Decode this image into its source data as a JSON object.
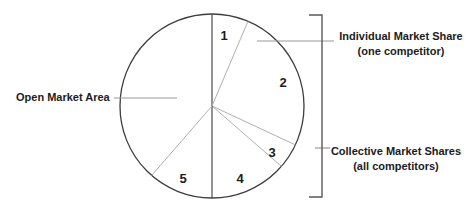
{
  "figure_name": "market-share-pie-diagram",
  "colors": {
    "background": "#ffffff",
    "outline": "#3c3c3c",
    "dark_divider": "#4a4a4a",
    "light_divider": "#b0b0b0",
    "leader": "#9a9a9a",
    "bracket": "#5a5a5a",
    "text": "#1c1c1c"
  },
  "pie": {
    "cx": 212,
    "cy": 106,
    "r": 92,
    "dividers": [
      {
        "angle_deg": 0,
        "tone": "dark"
      },
      {
        "angle_deg": 23,
        "tone": "light"
      },
      {
        "angle_deg": 115,
        "tone": "light"
      },
      {
        "angle_deg": 131,
        "tone": "light"
      },
      {
        "angle_deg": 180,
        "tone": "dark"
      },
      {
        "angle_deg": 221,
        "tone": "light"
      }
    ],
    "segment_labels": [
      {
        "text": "1",
        "x": 224,
        "y": 40
      },
      {
        "text": "2",
        "x": 283,
        "y": 87
      },
      {
        "text": "3",
        "x": 272,
        "y": 157
      },
      {
        "text": "4",
        "x": 240,
        "y": 183
      },
      {
        "text": "5",
        "x": 183,
        "y": 183
      }
    ]
  },
  "leader_lines": [
    {
      "name": "open-market-leader-line",
      "x1": 114,
      "y1": 98,
      "x2": 177,
      "y2": 98
    },
    {
      "name": "individual-share-leader-line",
      "x1": 257,
      "y1": 41,
      "x2": 334,
      "y2": 41
    },
    {
      "name": "collective-share-tick-line",
      "x1": 315,
      "y1": 148,
      "x2": 330,
      "y2": 148
    }
  ],
  "bracket": {
    "points": "309,15 322,15 322,197 309,197"
  },
  "labels": {
    "open_market": "Open Market Area",
    "individual_line1": "Individual Market Share",
    "individual_line2": "(one competitor)",
    "collective_line1": "Collective Market Shares",
    "collective_line2": "(all competitors)"
  },
  "chart_data": {
    "type": "pie",
    "title": "",
    "angle_reference": "degrees clockwise from 12 o'clock",
    "segments": [
      {
        "label": "1",
        "start_deg": 0,
        "end_deg": 23,
        "span_deg": 23,
        "share_pct": 6.4
      },
      {
        "label": "2",
        "start_deg": 23,
        "end_deg": 115,
        "span_deg": 92,
        "share_pct": 25.6
      },
      {
        "label": "3",
        "start_deg": 115,
        "end_deg": 131,
        "span_deg": 16,
        "share_pct": 4.4
      },
      {
        "label": "4",
        "start_deg": 131,
        "end_deg": 180,
        "span_deg": 49,
        "share_pct": 13.6
      },
      {
        "label": "5",
        "start_deg": 180,
        "end_deg": 221,
        "span_deg": 41,
        "share_pct": 11.4
      },
      {
        "label": "Open Market Area",
        "start_deg": 221,
        "end_deg": 360,
        "span_deg": 139,
        "share_pct": 38.6
      }
    ],
    "annotations": [
      "Open Market Area",
      "Individual Market Share (one competitor)",
      "Collective Market Shares (all competitors)"
    ],
    "legend_position": "none",
    "grid": false
  }
}
